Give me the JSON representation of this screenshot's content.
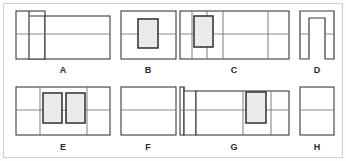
{
  "sheet": {
    "title": "Geometric figure comparison sheet",
    "background_color": "#ffffff",
    "border_color": "#cfcfcf",
    "stroke_color": "#3a3a3a",
    "divider_color": "#6e6e6e",
    "inner_fill_color": "#eceaea",
    "figure_count": 8
  },
  "figures": [
    {
      "id": "A",
      "label": "A",
      "row": 1,
      "description": "Tall narrow rectangle at left with horizontal midline, a raised notch block, and a wide rectangle at right with horizontal midline",
      "label_x": 63,
      "label_y": 73,
      "outer": {
        "x": 16,
        "y": 11,
        "w": 94,
        "h": 48
      },
      "midline_y": 34,
      "vertical_dividers_x": [
        31,
        45
      ],
      "inner_rects": [],
      "has_notch": true
    },
    {
      "id": "B",
      "label": "B",
      "row": 1,
      "description": "Rectangle with horizontal midline and one centered upright inner rectangle",
      "label_x": 148,
      "label_y": 73,
      "outer": {
        "x": 121,
        "y": 11,
        "w": 55,
        "h": 48
      },
      "midline_y": 34,
      "vertical_dividers_x": [],
      "inner_rects": [
        {
          "x": 138,
          "y": 19,
          "w": 20,
          "h": 29
        }
      ],
      "has_notch": false
    },
    {
      "id": "C",
      "label": "C",
      "row": 1,
      "description": "Wide rectangle with horizontal midline, several vertical dividers, and one upright inner rectangle near the left",
      "label_x": 234,
      "label_y": 73,
      "outer": {
        "x": 180,
        "y": 11,
        "w": 109,
        "h": 48
      },
      "midline_y": 34,
      "vertical_dividers_x": [
        192,
        207,
        223,
        268
      ],
      "inner_rects": [
        {
          "x": 194,
          "y": 16,
          "w": 19,
          "h": 31
        }
      ],
      "has_notch": false
    },
    {
      "id": "D",
      "label": "D",
      "row": 1,
      "description": "Inverted U arch shape with horizontal midline crossing both legs",
      "label_x": 317,
      "label_y": 73,
      "outer": {
        "x": 300,
        "y": 11,
        "w": 34,
        "h": 48
      },
      "midline_y": 34,
      "vertical_dividers_x": [],
      "inner_rects": [],
      "has_notch": false,
      "is_arch": true
    },
    {
      "id": "E",
      "label": "E",
      "row": 2,
      "description": "Rectangle with horizontal midline, vertical dividers, and two upright inner rectangles side by side",
      "label_x": 63,
      "label_y": 150,
      "outer": {
        "x": 16,
        "y": 87,
        "w": 94,
        "h": 48
      },
      "midline_y": 110,
      "vertical_dividers_x": [
        40,
        87
      ],
      "inner_rects": [
        {
          "x": 43,
          "y": 93,
          "w": 19,
          "h": 30
        },
        {
          "x": 66,
          "y": 93,
          "w": 19,
          "h": 30
        }
      ],
      "has_notch": false
    },
    {
      "id": "F",
      "label": "F",
      "row": 2,
      "description": "Plain rectangle with a single horizontal midline and no inner shapes",
      "label_x": 148,
      "label_y": 150,
      "outer": {
        "x": 121,
        "y": 87,
        "w": 55,
        "h": 48
      },
      "midline_y": 110,
      "vertical_dividers_x": [],
      "inner_rects": [],
      "has_notch": false
    },
    {
      "id": "G",
      "label": "G",
      "row": 2,
      "description": "Wide rectangle with horizontal midline, a tall notch at the far left, vertical dividers, and one upright inner rectangle right of center",
      "label_x": 234,
      "label_y": 150,
      "outer": {
        "x": 180,
        "y": 87,
        "w": 109,
        "h": 48
      },
      "midline_y": 110,
      "vertical_dividers_x": [
        196,
        243,
        271
      ],
      "inner_rects": [
        {
          "x": 246,
          "y": 92,
          "w": 20,
          "h": 31
        }
      ],
      "has_notch": true
    },
    {
      "id": "H",
      "label": "H",
      "row": 2,
      "description": "Plain rectangle with a single horizontal midline, narrower than F",
      "label_x": 317,
      "label_y": 150,
      "outer": {
        "x": 300,
        "y": 87,
        "w": 34,
        "h": 48
      },
      "midline_y": 110,
      "vertical_dividers_x": [],
      "inner_rects": [],
      "has_notch": false
    }
  ]
}
